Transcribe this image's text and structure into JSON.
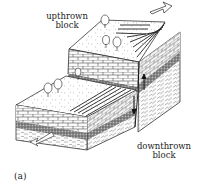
{
  "figure": {
    "panel_label": "(a)",
    "labels": {
      "upthrown_line1": "upthrown",
      "upthrown_line2": "block",
      "downthrown_line1": "downthrown",
      "downthrown_line2": "block"
    },
    "colors": {
      "ink": "#1a1a1a",
      "paper": "#ffffff",
      "stipple_band": "#6a6a6a",
      "face_light": "#f4f4f4"
    },
    "elements": [
      "upthrown block",
      "downthrown block",
      "fault plane",
      "fault scarp",
      "movement arrows",
      "trees",
      "limestone layer",
      "conglomerate band",
      "shale layer"
    ]
  }
}
